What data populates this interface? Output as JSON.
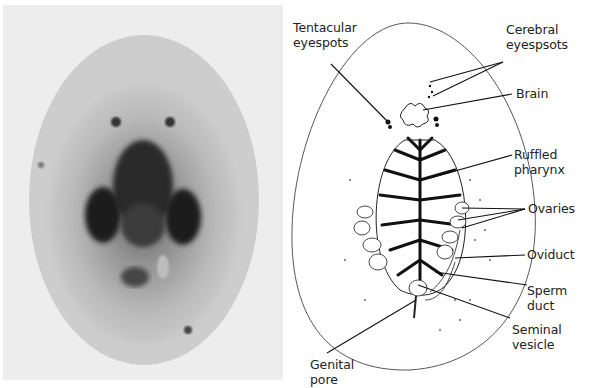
{
  "figure": {
    "left_panel": "micrograph",
    "right_panel": "labeled-drawing"
  },
  "labels": {
    "tentacular_eyespots": "Tentacular\neyespots",
    "cerebral_eyespots": "Cerebral\neyespsots",
    "brain": "Brain",
    "ruffled_pharynx": "Ruffled\npharynx",
    "ovaries": "Ovaries",
    "oviduct": "Oviduct",
    "sperm_duct": "Sperm\nduct",
    "seminal_vesicle": "Seminal\nvesicle",
    "genital_pore": "Genital\npore"
  },
  "colors": {
    "photo_bg": "#ededed",
    "body_fill": "#c9c9c9",
    "ink": "#1a1a1a"
  }
}
